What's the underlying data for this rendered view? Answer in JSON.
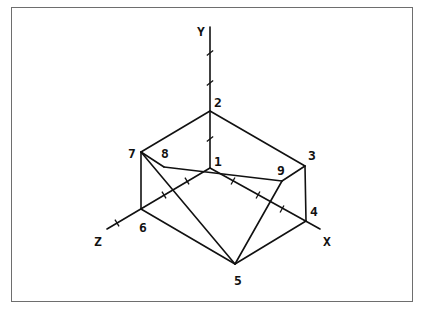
{
  "diagram": {
    "type": "3d-wireframe-axonometric",
    "axes": [
      {
        "name": "y-axis",
        "label": "Y",
        "from": [
          210,
          168
        ],
        "to": [
          210,
          27
        ],
        "label_pos": [
          197,
          36
        ],
        "ticks": [
          [
            210,
            139
          ],
          [
            210,
            83
          ],
          [
            210,
            53
          ]
        ]
      },
      {
        "name": "x-axis",
        "label": "X",
        "from": [
          210,
          168
        ],
        "to": [
          320,
          229
        ],
        "label_pos": [
          323,
          246
        ],
        "ticks": [
          [
            233,
            181
          ],
          [
            258,
            195
          ],
          [
            282,
            209
          ]
        ]
      },
      {
        "name": "z-axis",
        "label": "Z",
        "from": [
          210,
          168
        ],
        "to": [
          107,
          229
        ],
        "label_pos": [
          94,
          246
        ],
        "ticks": [
          [
            187,
            181
          ],
          [
            164,
            195
          ],
          [
            117,
            223
          ]
        ]
      }
    ],
    "points": [
      {
        "id": "1",
        "label": "1",
        "pos": [
          210,
          168
        ],
        "label_pos": [
          214,
          166
        ]
      },
      {
        "id": "2",
        "label": "2",
        "pos": [
          210,
          111
        ],
        "label_pos": [
          214,
          107
        ]
      },
      {
        "id": "3",
        "label": "3",
        "pos": [
          305,
          166
        ],
        "label_pos": [
          308,
          160
        ]
      },
      {
        "id": "4",
        "label": "4",
        "pos": [
          306,
          221
        ],
        "label_pos": [
          310,
          216
        ]
      },
      {
        "id": "5",
        "label": "5",
        "pos": [
          235,
          264
        ],
        "label_pos": [
          234,
          285
        ]
      },
      {
        "id": "6",
        "label": "6",
        "pos": [
          141,
          209
        ],
        "label_pos": [
          139,
          232
        ]
      },
      {
        "id": "7",
        "label": "7",
        "pos": [
          141,
          152
        ],
        "label_pos": [
          128,
          158
        ]
      },
      {
        "id": "8",
        "label": "8",
        "pos": [
          164,
          167
        ],
        "label_pos": [
          161,
          158
        ]
      },
      {
        "id": "9",
        "label": "9",
        "pos": [
          282,
          181
        ],
        "label_pos": [
          277,
          175
        ]
      }
    ],
    "edges": [
      [
        "2",
        "7"
      ],
      [
        "2",
        "3"
      ],
      [
        "7",
        "6"
      ],
      [
        "3",
        "4"
      ],
      [
        "7",
        "5"
      ],
      [
        "6",
        "5"
      ],
      [
        "4",
        "5"
      ],
      [
        "9",
        "5"
      ],
      [
        "8",
        "9"
      ],
      [
        "3",
        "9"
      ],
      [
        "7",
        "8"
      ]
    ]
  }
}
